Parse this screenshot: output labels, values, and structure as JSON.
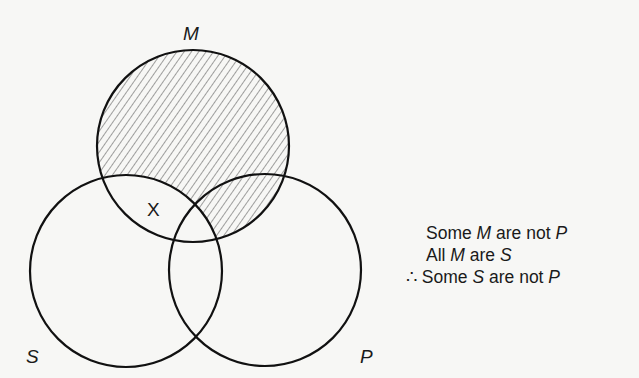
{
  "diagram": {
    "type": "venn",
    "circles": [
      {
        "id": "M",
        "label": "M",
        "cx": 193,
        "cy": 146,
        "r": 96
      },
      {
        "id": "S",
        "label": "S",
        "cx": 126,
        "cy": 271,
        "r": 96
      },
      {
        "id": "P",
        "label": "P",
        "cx": 265,
        "cy": 270,
        "r": 96
      }
    ],
    "shaded_region": "M outside S (hatched)",
    "marker": {
      "symbol": "X",
      "region": "M and S, outside P"
    },
    "stroke_color": "#111111"
  },
  "labels": {
    "M": "M",
    "S": "S",
    "P": "P",
    "x_mark": "X"
  },
  "syllogism": {
    "premise1": {
      "pre": "Some ",
      "term1": "M",
      "mid": " are not ",
      "term2": "P"
    },
    "premise2": {
      "pre": "All ",
      "term1": "M",
      "mid": " are ",
      "term2": "S"
    },
    "conclusion": {
      "therefore": "∴",
      "pre": " Some ",
      "term1": "S",
      "mid": " are not ",
      "term2": "P"
    }
  }
}
